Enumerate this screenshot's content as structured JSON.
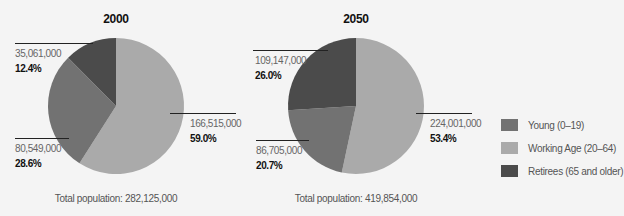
{
  "colors": {
    "young": "#727272",
    "working": "#aaaaaa",
    "retirees": "#4b4b4b",
    "background": "#f4f4f4"
  },
  "chart_data": [
    {
      "type": "pie",
      "title": "2000",
      "categories": [
        "Working Age (20–64)",
        "Young (0–19)",
        "Retirees (65 and older)"
      ],
      "values": [
        166515000,
        80549000,
        35061000
      ],
      "percentages": [
        59.0,
        28.6,
        12.4
      ],
      "value_labels": [
        "166,515,000",
        "80,549,000",
        "35,061,000"
      ],
      "percent_labels": [
        "59.0%",
        "28.6%",
        "12.4%"
      ],
      "total_label": "Total population: 282,125,000",
      "start_angle": "12 o'clock",
      "direction": "clockwise"
    },
    {
      "type": "pie",
      "title": "2050",
      "categories": [
        "Working Age (20–64)",
        "Young (0–19)",
        "Retirees (65 and older)"
      ],
      "values": [
        224001000,
        86705000,
        109147000
      ],
      "percentages": [
        53.4,
        20.7,
        26.0
      ],
      "value_labels": [
        "224,001,000",
        "86,705,000",
        "109,147,000"
      ],
      "percent_labels": [
        "53.4%",
        "20.7%",
        "26.0%"
      ],
      "total_label": "Total population: 419,854,000",
      "start_angle": "12 o'clock",
      "direction": "clockwise"
    }
  ],
  "legend": {
    "position": "right",
    "items": [
      {
        "label": "Young (0–19)",
        "color": "#727272"
      },
      {
        "label": "Working Age (20–64)",
        "color": "#aaaaaa"
      },
      {
        "label": "Retirees (65 and older)",
        "color": "#4b4b4b"
      }
    ]
  }
}
